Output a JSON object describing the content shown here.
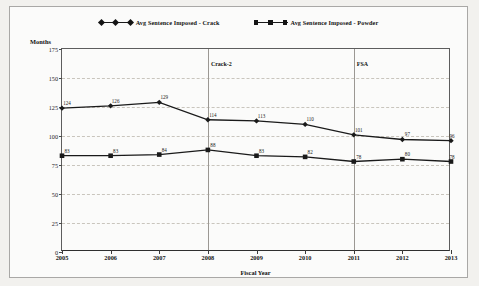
{
  "legend": {
    "items": [
      {
        "label": "Avg Sentence Imposed - Crack",
        "marker": "diamond",
        "color": "#141414"
      },
      {
        "label": "Avg Sentence Imposed - Powder",
        "marker": "square",
        "color": "#141414"
      }
    ]
  },
  "axis": {
    "y_title": "Months",
    "x_title": "Fiscal Year",
    "y_ticks": [
      "0",
      "25",
      "50",
      "75",
      "100",
      "125",
      "150",
      "175"
    ],
    "x_ticks": [
      "2005",
      "2006",
      "2007",
      "2008",
      "2009",
      "2010",
      "2011",
      "2012",
      "2013"
    ]
  },
  "annotations": [
    {
      "label": "Crack-2",
      "at_category": "2008"
    },
    {
      "label": "FSA",
      "at_category": "2011"
    }
  ],
  "colors": {
    "line": "#1a1a1a",
    "grid": "#c9c5bd",
    "axis": "#5d5d5d",
    "frame": "#a9a8a6",
    "page_background": "#f2f1ee",
    "plot_background": "#fbfbfa"
  },
  "chart_data": {
    "type": "line",
    "title": "",
    "xlabel": "Fiscal Year",
    "ylabel": "Months",
    "ylim": [
      0,
      175
    ],
    "ytick_step": 25,
    "grid": true,
    "legend_position": "top-center",
    "categories": [
      "2005",
      "2006",
      "2007",
      "2008",
      "2009",
      "2010",
      "2011",
      "2012",
      "2013"
    ],
    "series": [
      {
        "name": "Avg Sentence Imposed - Crack",
        "marker": "diamond",
        "values": [
          124,
          126,
          129,
          114,
          113,
          110,
          101,
          97,
          96
        ]
      },
      {
        "name": "Avg Sentence Imposed - Powder",
        "marker": "square",
        "values": [
          83,
          83,
          84,
          88,
          83,
          82,
          78,
          80,
          78
        ]
      }
    ]
  }
}
